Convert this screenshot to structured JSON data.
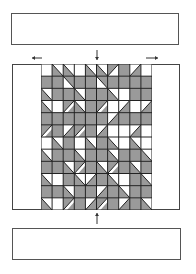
{
  "diagram": {
    "top_box": {
      "label": ""
    },
    "bottom_box": {
      "label": ""
    },
    "colors": {
      "gray": "#9a9a9a",
      "line": "#222222",
      "white": "#ffffff",
      "frame": "#444444"
    },
    "arrows": [
      {
        "name": "arrow-down-top",
        "direction": "down",
        "x": 97,
        "y1": 50,
        "y2": 60
      },
      {
        "name": "arrow-up-bottom",
        "direction": "up",
        "x": 97,
        "y1": 224,
        "y2": 213
      },
      {
        "name": "arrow-left-top",
        "direction": "left",
        "x1": 42,
        "x2": 32,
        "y": 58
      },
      {
        "name": "arrow-right-top",
        "direction": "right",
        "x1": 146,
        "x2": 158,
        "y": 58
      }
    ],
    "grid": {
      "cols": 10,
      "rows": 12,
      "cells": [
        [
          "w",
          "a",
          "a",
          "w",
          "a",
          "a",
          "d",
          "g",
          "c",
          "w"
        ],
        [
          "g",
          "g",
          "b",
          "g",
          "g",
          "b",
          "g",
          "g",
          "g",
          "g"
        ],
        [
          "a",
          "g",
          "g",
          "a",
          "g",
          "g",
          "a",
          "w",
          "g",
          "g"
        ],
        [
          "a",
          "w",
          "e",
          "a",
          "g",
          "e",
          "w",
          "c",
          "w",
          "c"
        ],
        [
          "g",
          "g",
          "g",
          "g",
          "g",
          "g",
          "c",
          "g",
          "g",
          "g"
        ],
        [
          "e",
          "g",
          "c",
          "e",
          "g",
          "c",
          "w",
          "w",
          "c",
          "w"
        ],
        [
          "w",
          "a",
          "g",
          "w",
          "a",
          "g",
          "a",
          "w",
          "a",
          "w"
        ],
        [
          "a",
          "g",
          "g",
          "a",
          "g",
          "g",
          "a",
          "g",
          "g",
          "a"
        ],
        [
          "g",
          "g",
          "a",
          "e",
          "g",
          "a",
          "e",
          "g",
          "a",
          "g"
        ],
        [
          "a",
          "w",
          "g",
          "a",
          "c",
          "g",
          "a",
          "w",
          "g",
          "a"
        ],
        [
          "g",
          "g",
          "a",
          "g",
          "g",
          "c",
          "g",
          "a",
          "g",
          "g"
        ],
        [
          "a",
          "w",
          "e",
          "g",
          "c",
          "e",
          "g",
          "c",
          "g",
          "a"
        ]
      ]
    }
  }
}
